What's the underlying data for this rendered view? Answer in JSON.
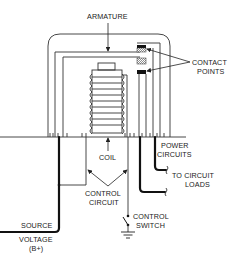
{
  "diagram": {
    "labels": {
      "armature": "ARMATURE",
      "contact_points_1": "CONTACT",
      "contact_points_2": "POINTS",
      "coil": "COIL",
      "power_circuits_1": "POWER",
      "power_circuits_2": "CIRCUITS",
      "to_circuit_loads_1": "TO CIRCUIT",
      "to_circuit_loads_2": "LOADS",
      "control_circuit_1": "CONTROL",
      "control_circuit_2": "CIRCUIT",
      "control_switch_1": "CONTROL",
      "control_switch_2": "SWITCH",
      "source_voltage_1": "SOURCE",
      "source_voltage_2": "VOLTAGE",
      "source_voltage_3": "(B+)"
    },
    "components": [
      "armature",
      "contact-points",
      "coil",
      "control-circuit",
      "control-switch",
      "ground",
      "power-circuits",
      "source-voltage"
    ],
    "colors": {
      "line": "#333333",
      "background": "#ffffff"
    }
  }
}
